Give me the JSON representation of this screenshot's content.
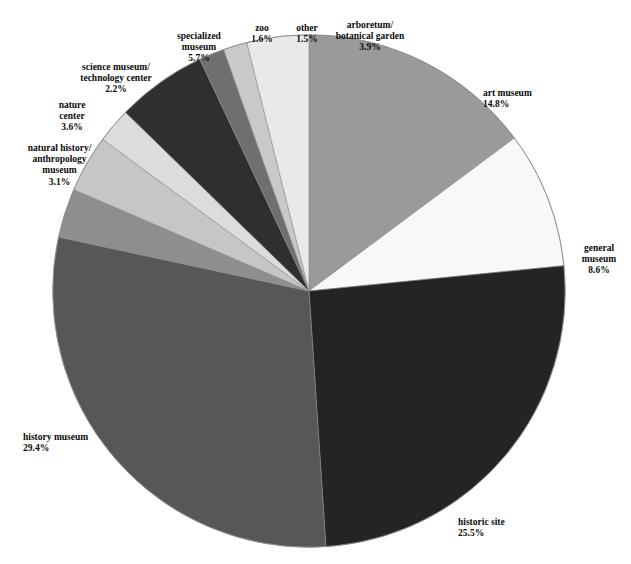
{
  "title": "",
  "chart_data": {
    "type": "pie",
    "title": "",
    "subtitle": "",
    "xlabel": "",
    "ylabel": "",
    "units": "percent",
    "legend": "none (labels placed around pie)",
    "start_angle_deg": 0,
    "direction": "clockwise",
    "total": 100.0,
    "categories": [
      "art museum",
      "general museum",
      "historic site",
      "history museum",
      "natural history/\nanthropology museum",
      "nature center",
      "science museum/\ntechnology center",
      "specialized museum",
      "zoo",
      "other",
      "arboretum/\nbotanical garden"
    ],
    "values": [
      14.8,
      8.6,
      25.5,
      29.4,
      3.1,
      3.6,
      2.2,
      5.7,
      1.6,
      1.5,
      3.9
    ],
    "slices": [
      {
        "id": "art-museum",
        "label_lines": [
          "art museum"
        ],
        "value": 14.8,
        "percent_text": "14.8%",
        "color": "#9a9a9a"
      },
      {
        "id": "general-museum",
        "label_lines": [
          "general",
          "museum"
        ],
        "value": 8.6,
        "percent_text": "8.6%",
        "color": "#f8f8f8"
      },
      {
        "id": "historic-site",
        "label_lines": [
          "historic site"
        ],
        "value": 25.5,
        "percent_text": "25.5%",
        "color": "#242424"
      },
      {
        "id": "history-museum",
        "label_lines": [
          "history museum"
        ],
        "value": 29.4,
        "percent_text": "29.4%",
        "color": "#575757"
      },
      {
        "id": "natural-history-anthropology-museum",
        "label_lines": [
          "natural history/",
          "anthropology",
          "museum"
        ],
        "value": 3.1,
        "percent_text": "3.1%",
        "color": "#8e8e8e"
      },
      {
        "id": "nature-center",
        "label_lines": [
          "nature",
          "center"
        ],
        "value": 3.6,
        "percent_text": "3.6%",
        "color": "#c6c6c6"
      },
      {
        "id": "science-museum-technology-center",
        "label_lines": [
          "science museum/",
          "technology center"
        ],
        "value": 2.2,
        "percent_text": "2.2%",
        "color": "#dcdcdc"
      },
      {
        "id": "specialized-museum",
        "label_lines": [
          "specialized",
          "museum"
        ],
        "value": 5.7,
        "percent_text": "5.7%",
        "color": "#2f2f2f"
      },
      {
        "id": "zoo",
        "label_lines": [
          "zoo"
        ],
        "value": 1.6,
        "percent_text": "1.6%",
        "color": "#6f6f6f"
      },
      {
        "id": "other",
        "label_lines": [
          "other"
        ],
        "value": 1.5,
        "percent_text": "1.5%",
        "color": "#c9c9c9"
      },
      {
        "id": "arboretum-botanical-garden",
        "label_lines": [
          "arboretum/",
          "botanical garden"
        ],
        "value": 3.9,
        "percent_text": "3.9%",
        "color": "#e9e9e9"
      }
    ]
  },
  "labels": {
    "art_museum": {
      "name": "art museum",
      "pct": "14.8%"
    },
    "general_museum": {
      "line1": "general",
      "line2": "museum",
      "pct": "8.6%"
    },
    "historic_site": {
      "name": "historic site",
      "pct": "25.5%"
    },
    "history_museum": {
      "name": "history museum",
      "pct": "29.4%"
    },
    "natural_history": {
      "line1": "natural history/",
      "line2": "anthropology",
      "line3": "museum",
      "pct": "3.1%"
    },
    "nature_center": {
      "line1": "nature",
      "line2": "center",
      "pct": "3.6%"
    },
    "science_museum": {
      "line1": "science museum/",
      "line2": "technology center",
      "pct": "2.2%"
    },
    "specialized_museum": {
      "line1": "specialized",
      "line2": "museum",
      "pct": "5.7%"
    },
    "zoo": {
      "name": "zoo",
      "pct": "1.6%"
    },
    "other": {
      "name": "other",
      "pct": "1.5%"
    },
    "arboretum": {
      "line1": "arboretum/",
      "line2": "botanical garden",
      "pct": "3.9%"
    }
  },
  "colors": {
    "background": "#ffffff",
    "text": "#0b0b0b",
    "outline": "#8a8a8a"
  }
}
